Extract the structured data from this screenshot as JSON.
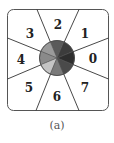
{
  "diagram": {
    "sectors": [
      {
        "label": "0",
        "color": "#2e2e2e"
      },
      {
        "label": "1",
        "color": "#3c3c3c"
      },
      {
        "label": "2",
        "color": "#5a5a5a"
      },
      {
        "label": "3",
        "color": "#9a9a9a"
      },
      {
        "label": "4",
        "color": "#8a8a8a"
      },
      {
        "label": "5",
        "color": "#c4c4c4"
      },
      {
        "label": "6",
        "color": "#7a7a7a"
      },
      {
        "label": "7",
        "color": "#4a4a4a"
      }
    ],
    "caption": "(a)"
  }
}
